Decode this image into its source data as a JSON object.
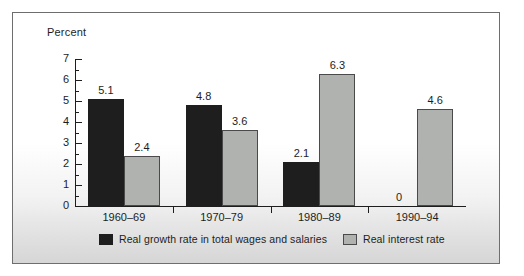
{
  "chart_data": {
    "type": "bar",
    "title": "",
    "ylabel": "Percent",
    "xlabel": "",
    "ylim": [
      0,
      7
    ],
    "yticks": [
      0,
      1,
      2,
      3,
      4,
      5,
      6,
      7
    ],
    "ytick_labels": [
      "0",
      "1",
      "2",
      "3",
      "4",
      "5",
      "6",
      "7"
    ],
    "minor_ticks": [
      0.5,
      1.5,
      2.5,
      3.5,
      4.5,
      5.5,
      6.5
    ],
    "grid": false,
    "legend_position": "bottom",
    "categories": [
      "1960–69",
      "1970–79",
      "1980–89",
      "1990–94"
    ],
    "series": [
      {
        "name": "Real growth rate in total wages and salaries",
        "color": "#1e1e1e",
        "values": [
          5.1,
          4.8,
          2.1,
          0
        ],
        "labels": [
          "5.1",
          "4.8",
          "2.1",
          "0"
        ]
      },
      {
        "name": "Real interest rate",
        "color": "#b0b2b0",
        "values": [
          2.4,
          3.6,
          6.3,
          4.6
        ],
        "labels": [
          "2.4",
          "3.6",
          "6.3",
          "4.6"
        ]
      }
    ]
  },
  "axis": {
    "y_title": "Percent"
  },
  "legend": {
    "items": [
      {
        "label": "Real growth rate in total wages and salaries",
        "swatch": "dark"
      },
      {
        "label": "Real interest rate",
        "swatch": "light"
      }
    ]
  },
  "colors": {
    "series_dark": "#1e1e1e",
    "series_light": "#b0b2b0",
    "axis": "#1d1d1d",
    "frame_border": "#6e6e6e"
  }
}
